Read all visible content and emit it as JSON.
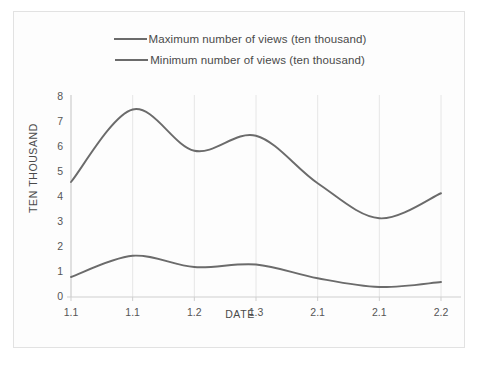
{
  "chart_data": {
    "type": "line",
    "title": "",
    "xlabel": "DATE",
    "ylabel": "TEN THOUSAND",
    "ylim": [
      0,
      8
    ],
    "yticks": [
      0,
      1,
      2,
      3,
      4,
      5,
      6,
      7,
      8
    ],
    "categories": [
      "1.1",
      "1.1",
      "1.2",
      "1.3",
      "2.1",
      "2.1",
      "2.2"
    ],
    "grid": "vertical",
    "legend_position": "top-center",
    "series": [
      {
        "name": "Maximum number of views (ten thousand)",
        "color": "#6b6b6b",
        "values": [
          4.6,
          7.5,
          5.85,
          6.45,
          4.55,
          3.15,
          4.15
        ]
      },
      {
        "name": "Minimum number of views (ten thousand)",
        "color": "#6b6b6b",
        "values": [
          0.8,
          1.65,
          1.2,
          1.3,
          0.75,
          0.4,
          0.6
        ]
      }
    ]
  },
  "legend": {
    "items": [
      {
        "label": "Maximum number of views (ten thousand)"
      },
      {
        "label": "Minimum number of views (ten thousand)"
      }
    ]
  },
  "axes": {
    "x_title": "DATE",
    "y_title": "TEN THOUSAND",
    "x_tick_labels": [
      "1.1",
      "1.1",
      "1.2",
      "1.3",
      "2.1",
      "2.1",
      "2.2"
    ],
    "y_tick_labels": [
      "0",
      "1",
      "2",
      "3",
      "4",
      "5",
      "6",
      "7",
      "8"
    ]
  },
  "colors": {
    "line": "#6b6b6b",
    "grid": "#e6e6e6",
    "axis": "#cfcfcf",
    "frame": "#e2e2e2",
    "text": "#4a4a4a"
  }
}
